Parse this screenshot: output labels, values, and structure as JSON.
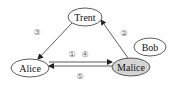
{
  "diagram": {
    "nodes": [
      {
        "id": "trent",
        "label": "Trent",
        "fill": "#ffffff",
        "cx": 85,
        "cy": 17,
        "rx": 17,
        "ry": 9
      },
      {
        "id": "bob",
        "label": "Bob",
        "fill": "#ffffff",
        "cx": 150,
        "cy": 47,
        "rx": 16,
        "ry": 9
      },
      {
        "id": "alice",
        "label": "Alice",
        "fill": "#ffffff",
        "cx": 30,
        "cy": 68,
        "rx": 19,
        "ry": 9
      },
      {
        "id": "malice",
        "label": "Malice",
        "fill": "#d4d4d4",
        "cx": 131,
        "cy": 67,
        "rx": 19,
        "ry": 9
      }
    ],
    "steps": [
      {
        "id": "1",
        "symbol": "①"
      },
      {
        "id": "2",
        "symbol": "②"
      },
      {
        "id": "3",
        "symbol": "③"
      },
      {
        "id": "4",
        "symbol": "④"
      },
      {
        "id": "5",
        "symbol": "⑤"
      }
    ],
    "edges": [
      {
        "from": "alice",
        "to": "malice",
        "steps": [
          "1",
          "4"
        ]
      },
      {
        "from": "malice",
        "to": "trent",
        "steps": [
          "2"
        ]
      },
      {
        "from": "trent",
        "to": "alice",
        "steps": [
          "3"
        ]
      },
      {
        "from": "malice",
        "to": "alice",
        "steps": [
          "5"
        ]
      }
    ]
  }
}
